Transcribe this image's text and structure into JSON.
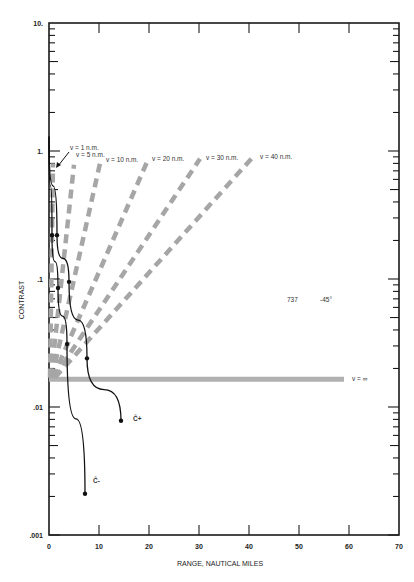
{
  "chart_data": {
    "type": "line",
    "title": "",
    "xlabel": "RANGE, NAUTICAL MILES",
    "ylabel": "CONTRAST",
    "xlim": [
      0,
      70
    ],
    "ylim": [
      0.001,
      10
    ],
    "yscale": "log",
    "grid": false,
    "x_ticks": [
      "0",
      "10",
      "20",
      "30",
      "40",
      "50",
      "60",
      "70"
    ],
    "y_ticks": [
      "10.",
      "1.",
      ".1",
      ".01",
      ".001"
    ],
    "annotations": {
      "aircraft": "737",
      "angle": "-45°",
      "c_plus": "Ĉ+",
      "c_minus": "Ĉ-"
    },
    "series": [
      {
        "name": "Ĉ+",
        "style": "solid-black-with-markers",
        "x": [
          0,
          1.6,
          4.0,
          7.6,
          14.4
        ],
        "y": [
          1.3,
          0.22,
          0.095,
          0.024,
          0.0078
        ]
      },
      {
        "name": "Ĉ-",
        "style": "solid-black-with-markers",
        "x": [
          0,
          0.6,
          1.8,
          3.6,
          7.2
        ],
        "y": [
          1.3,
          0.22,
          0.085,
          0.031,
          0.0021
        ]
      },
      {
        "name": "v = 1 n.m.",
        "style": "dashed-gray",
        "x": [
          0.2,
          0.8
        ],
        "y": [
          0.017,
          0.8
        ]
      },
      {
        "name": "v = 5 n.m.",
        "style": "dashed-gray",
        "x": [
          0.4,
          5.0
        ],
        "y": [
          0.017,
          0.78
        ]
      },
      {
        "name": "v = 10 n.m.",
        "style": "dashed-gray",
        "x": [
          0.6,
          10.2
        ],
        "y": [
          0.017,
          0.8
        ]
      },
      {
        "name": "v = 20 n.m.",
        "style": "dashed-gray",
        "x": [
          0.8,
          19.6
        ],
        "y": [
          0.017,
          0.82
        ]
      },
      {
        "name": "v = 30 n.m.",
        "style": "dashed-gray",
        "x": [
          1.0,
          30.2
        ],
        "y": [
          0.017,
          0.87
        ]
      },
      {
        "name": "v = 40 n.m.",
        "style": "dashed-gray",
        "x": [
          1.2,
          40.8
        ],
        "y": [
          0.017,
          0.9
        ]
      },
      {
        "name": "v = ∞",
        "style": "thick-gray-horizontal",
        "x": [
          0,
          59
        ],
        "y": [
          0.0165,
          0.0165
        ]
      }
    ],
    "legend_labels": {
      "v1": "v = 1 n.m.",
      "v5": "v = 5 n.m.",
      "v10": "v = 10 n.m.",
      "v20": "v = 20 n.m.",
      "v30": "v = 30 n.m.",
      "v40": "v = 40 n.m.",
      "vinf": "v = ∞"
    },
    "colors": {
      "axis": "#1a1a1a",
      "curve": "#111111",
      "dashed": "#a6a6a6",
      "band": "#b0b0b0"
    }
  }
}
